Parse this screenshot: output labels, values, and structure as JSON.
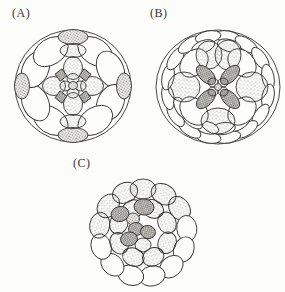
{
  "figure": {
    "panels": [
      {
        "label": "(A)"
      },
      {
        "label": "(B)"
      },
      {
        "label": "(C)"
      }
    ]
  },
  "colors": {
    "background": "#fcfcfa",
    "ink": "#333333",
    "stipple_light": "#6e6e6e",
    "stipple_dark": "#323232"
  }
}
